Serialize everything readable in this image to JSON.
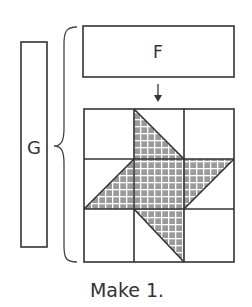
{
  "diagram": {
    "labels": {
      "f_piece": "F",
      "g_piece": "G",
      "caption": "Make 1."
    },
    "grid": {
      "rows": 3,
      "cols": 3
    },
    "colors": {
      "stroke": "#333333",
      "fill_pattern_base": "#9a9a9a",
      "fill_pattern_lines": "#ffffff",
      "background": "#ffffff"
    }
  }
}
